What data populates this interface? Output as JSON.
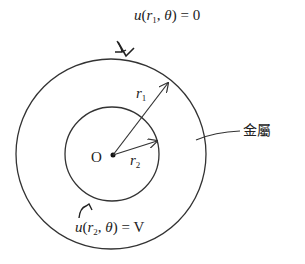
{
  "diagram": {
    "type": "concentric-circles-boundary-problem",
    "center_label": "O",
    "outer_radius_label": {
      "var": "r",
      "sub": "1"
    },
    "inner_radius_label": {
      "var": "r",
      "sub": "2"
    },
    "outer_boundary_condition": {
      "func": "u",
      "arg_var": "r",
      "arg_sub": "1",
      "angle": "θ",
      "value": "0"
    },
    "inner_boundary_condition": {
      "func": "u",
      "arg_var": "r",
      "arg_sub": "2",
      "angle": "θ",
      "value": "V"
    },
    "material_label": "金屬",
    "colors": {
      "stroke": "#333333",
      "text": "#222222",
      "background": "#ffffff"
    }
  }
}
